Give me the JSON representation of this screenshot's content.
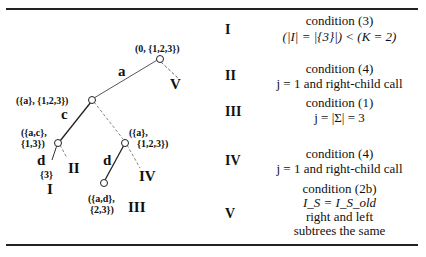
{
  "tree": {
    "nodes": [
      {
        "label": "(0, {1,2,3})"
      },
      {
        "label": "({a}, {1,2,3})"
      },
      {
        "label_line1": "({a,c},",
        "label_line2": "{1,3})"
      },
      {
        "label_line1": "({a},",
        "label_line2": "{1,2,3})"
      },
      {
        "label_line1": "({a,d},",
        "label_line2": "{2,3})"
      }
    ],
    "edges": [
      "a",
      "c",
      "d",
      "d"
    ],
    "leaf_set": "{3}",
    "cases": [
      "I",
      "II",
      "III",
      "IV",
      "V"
    ]
  },
  "table": {
    "rows": [
      {
        "id": "I",
        "lines": [
          "condition (3)",
          "(|I| = |{3}|) < (K = 2)"
        ]
      },
      {
        "id": "II",
        "lines": [
          "condition (4)",
          "j = 1 and right-child call"
        ]
      },
      {
        "id": "III",
        "lines": [
          "condition (1)",
          "j = |Σ| = 3"
        ]
      },
      {
        "id": "IV",
        "lines": [
          "condition (4)",
          "j = 1 and right-child call"
        ]
      },
      {
        "id": "V",
        "lines": [
          "condition (2b)",
          "I_S = I_S_old",
          "right and left",
          "subtrees the same"
        ]
      }
    ]
  }
}
